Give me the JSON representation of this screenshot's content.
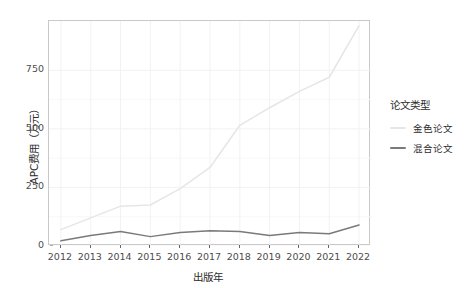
{
  "chart_data": {
    "type": "line",
    "title": "",
    "xlabel": "出版年",
    "ylabel": "APC费用（万元）",
    "x": [
      2012,
      2013,
      2014,
      2015,
      2016,
      2017,
      2018,
      2019,
      2020,
      2021,
      2022
    ],
    "xtick_labels": [
      "2012",
      "2013",
      "2014",
      "2015",
      "2016",
      "2017",
      "2018",
      "2019",
      "2020",
      "2021",
      "2022"
    ],
    "ytick_labels": [
      "0",
      "250",
      "500",
      "750"
    ],
    "ytick_values": [
      0,
      250,
      500,
      750
    ],
    "xlim": [
      2011.6,
      2022.4
    ],
    "ylim": [
      0,
      960
    ],
    "grid": true,
    "legend_position": "right",
    "legend_title": "论文类型",
    "series": [
      {
        "name": "金色论文",
        "color": "#e6e6e6",
        "values": [
          70,
          120,
          170,
          175,
          245,
          335,
          515,
          590,
          660,
          720,
          940
        ]
      },
      {
        "name": "混合论文",
        "color": "#7a7a7a",
        "values": [
          22,
          45,
          62,
          40,
          58,
          65,
          62,
          45,
          58,
          52,
          90
        ]
      }
    ]
  },
  "axis": {
    "y_title": "APC费用（万元）",
    "x_title": "出版年"
  },
  "legend": {
    "title": "论文类型",
    "items": [
      {
        "label": "金色论文",
        "color": "#e6e6e6"
      },
      {
        "label": "混合论文",
        "color": "#7a7a7a"
      }
    ]
  },
  "colors": {
    "panel_border": "#c9c9c9",
    "grid": "#f2f2f2",
    "tick_text": "#4d4d4d",
    "title_text": "#2b2b2b",
    "background": "#ffffff"
  }
}
